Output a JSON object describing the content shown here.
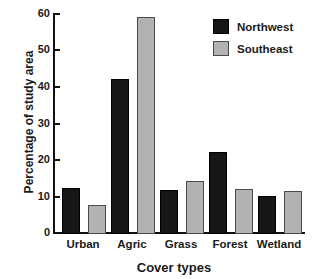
{
  "chart_data": {
    "type": "bar",
    "title": "",
    "xlabel": "Cover types",
    "ylabel": "Percentage of study area",
    "categories": [
      "Urban",
      "Agric",
      "Grass",
      "Forest",
      "Wetland"
    ],
    "series": [
      {
        "name": "Northwest",
        "color": "#161616",
        "values": [
          12.4,
          42.0,
          12.0,
          22.2,
          10.3
        ]
      },
      {
        "name": "Southeast",
        "color": "#b2b2b2",
        "values": [
          7.9,
          59.0,
          14.3,
          12.2,
          11.6
        ]
      }
    ],
    "ylim": [
      0,
      60
    ],
    "yticks": [
      0,
      10,
      20,
      30,
      40,
      50,
      60
    ],
    "ytick_labels": [
      "0",
      "10",
      "20",
      "30",
      "40",
      "50",
      "60"
    ],
    "grid": false,
    "legend_position": "top-right",
    "legend": [
      "Northwest",
      "Southeast"
    ]
  }
}
